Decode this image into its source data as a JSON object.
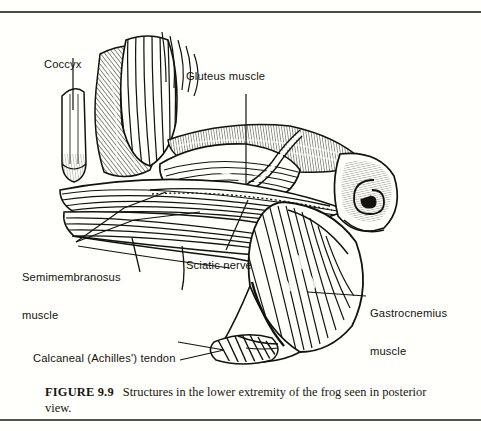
{
  "figure": {
    "caption_number": "FIGURE 9.9",
    "caption_text": "Structures in the lower extremity of the frog seen in posterior view.",
    "view": "posterior",
    "subject": "frog",
    "illustration_style": "line engraving with hatching"
  },
  "labels": {
    "coccyx": "Coccyx",
    "gluteus": "Gluteus muscle",
    "semimembranosus_line1": "Semimembranosus",
    "semimembranosus_line2": "muscle",
    "sciatic": "Sciatic nerve",
    "gastrocnemius_line1": "Gastrocnemius",
    "gastrocnemius_line2": "muscle",
    "calcaneal": "Calcaneal (Achilles') tendon"
  },
  "colors": {
    "ink": "#13120f",
    "paper": "#fffffb",
    "rule": "#4a4a48",
    "hatch": "#1b1a17"
  }
}
